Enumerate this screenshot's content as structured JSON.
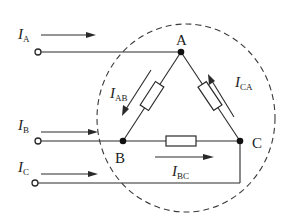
{
  "diagram": {
    "type": "delta-connected three-phase load",
    "nodes": {
      "A": "A",
      "B": "B",
      "C": "C"
    },
    "line_currents": {
      "A": {
        "symbol": "I",
        "subscript": "A"
      },
      "B": {
        "symbol": "I",
        "subscript": "B"
      },
      "C": {
        "symbol": "I",
        "subscript": "C"
      }
    },
    "phase_currents": {
      "AB": {
        "symbol": "I",
        "subscript": "AB"
      },
      "BC": {
        "symbol": "I",
        "subscript": "BC"
      },
      "CA": {
        "symbol": "I",
        "subscript": "CA"
      }
    },
    "colors": {
      "line": "#2a2a2a",
      "background": "#ffffff"
    }
  }
}
